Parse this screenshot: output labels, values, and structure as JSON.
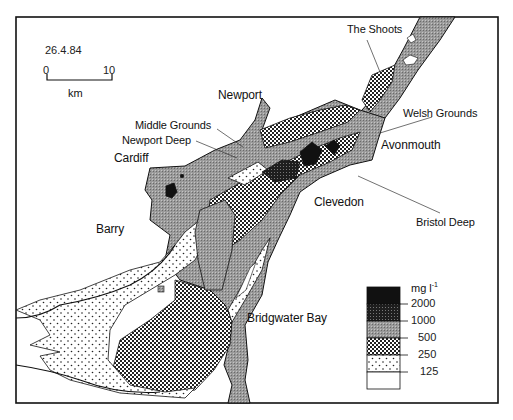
{
  "map": {
    "date": "26.4.84",
    "scale": {
      "start": "0",
      "end": "10",
      "unit": "km"
    },
    "places": [
      {
        "name": "The Shoots"
      },
      {
        "name": "Newport"
      },
      {
        "name": "Welsh Grounds"
      },
      {
        "name": "Middle Grounds"
      },
      {
        "name": "Newport Deep"
      },
      {
        "name": "Cardiff"
      },
      {
        "name": "Avonmouth"
      },
      {
        "name": "Clevedon"
      },
      {
        "name": "Bristol Deep"
      },
      {
        "name": "Barry"
      },
      {
        "name": "Bridgwater Bay"
      }
    ],
    "legend": {
      "unit": "mg l",
      "unit_sup": "-1",
      "breaks": [
        "2000",
        "1000",
        "500",
        "250",
        "125"
      ],
      "classes": [
        {
          "range": ">2000",
          "fill": "black"
        },
        {
          "range": "1000-2000",
          "fill": "dark-crosshatch"
        },
        {
          "range": "500-1000",
          "fill": "grey-stipple"
        },
        {
          "range": "250-500",
          "fill": "checker"
        },
        {
          "range": "125-250",
          "fill": "sparse-dots"
        },
        {
          "range": "<125",
          "fill": "white"
        }
      ]
    }
  }
}
